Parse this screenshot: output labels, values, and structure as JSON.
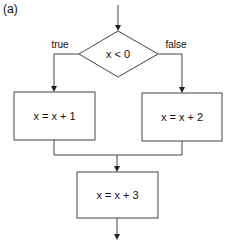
{
  "panel_label": "(a)",
  "decision": {
    "condition": "x < 0",
    "true_label": "true",
    "false_label": "false"
  },
  "boxes": {
    "true_branch": "x = x + 1",
    "false_branch": "x = x + 2",
    "merge": "x = x + 3"
  },
  "colors": {
    "stroke": "#444444",
    "background": "#ffffff",
    "text": "#111111"
  }
}
